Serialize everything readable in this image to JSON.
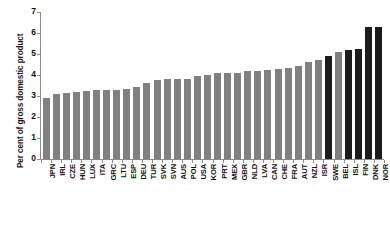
{
  "chart_data": {
    "type": "bar",
    "title": "",
    "subtitle": "",
    "xlabel": "",
    "ylabel": "Per cent of gross domestic product",
    "ylim": [
      0,
      7
    ],
    "ytick_labels": [
      "0",
      "1",
      "2",
      "3",
      "4",
      "5",
      "6",
      "7"
    ],
    "ytick_values": [
      0,
      1,
      2,
      3,
      4,
      5,
      6,
      7
    ],
    "grid": false,
    "legend": null,
    "categories": [
      "JPN",
      "IRL",
      "CZE",
      "HUN",
      "LUX",
      "ITA",
      "GRC",
      "LTU",
      "ESP",
      "DEU",
      "TUR",
      "SVK",
      "SVN",
      "AUS",
      "POL",
      "USA",
      "KOR",
      "PRT",
      "MEX",
      "GBR",
      "NLD",
      "LVA",
      "CAN",
      "CHE",
      "FRA",
      "AUT",
      "NZL",
      "ISR",
      "SWE",
      "BEL",
      "ISL",
      "FIN",
      "DNK",
      "NOR"
    ],
    "values": [
      2.9,
      3.1,
      3.15,
      3.2,
      3.25,
      3.3,
      3.3,
      3.3,
      3.35,
      3.45,
      3.6,
      3.75,
      3.8,
      3.8,
      3.8,
      3.95,
      4.0,
      4.1,
      4.1,
      4.1,
      4.2,
      4.2,
      4.25,
      4.3,
      4.35,
      4.45,
      4.6,
      4.7,
      4.9,
      5.1,
      5.2,
      5.25,
      6.3,
      6.3
    ],
    "bar_styles": [
      "light",
      "light",
      "light",
      "light",
      "light",
      "light",
      "light",
      "light",
      "light",
      "light",
      "light",
      "light",
      "light",
      "light",
      "light",
      "light",
      "light",
      "light",
      "light",
      "light",
      "light",
      "light",
      "light",
      "light",
      "light",
      "light",
      "light",
      "light",
      "dark",
      "light",
      "dark",
      "dark",
      "dark",
      "dark"
    ],
    "colors": {
      "light_bar": "#808080",
      "dark_bar": "#1c1c1c",
      "axis": "#8c8c8c",
      "text": "#111111",
      "background": "#ffffff"
    }
  }
}
